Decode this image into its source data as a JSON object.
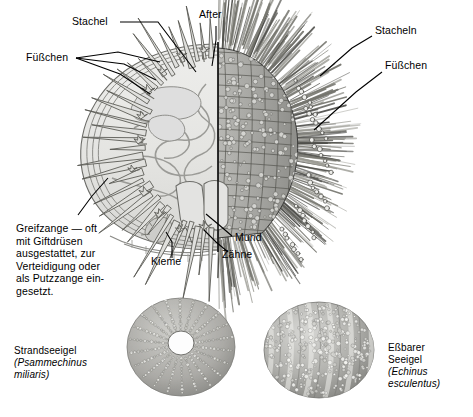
{
  "figure": {
    "background_color": "#ffffff",
    "ink_color": "#000000",
    "body_fill": "#e8e8e6",
    "shade_mid": "#9a9a98",
    "shade_dark": "#6e6e6c"
  },
  "labels": {
    "stachel": "Stachel",
    "fuesschen_left": "Füßchen",
    "after": "After",
    "stacheln_right": "Stacheln",
    "fuesschen_right": "Füßchen",
    "mund": "Mund",
    "zaehne": "Zähne",
    "kieme": "Kieme",
    "greifzange": "Greifzange — oft\nmit Giftdrüsen\nausgestattet, zur\nVerteidigung oder\nals Putzzange ein-\ngesetzt."
  },
  "specimens": [
    {
      "id": "strandseeigel",
      "common_name": "Strandseeigel",
      "scientific_name": "(Psammechinus\nmiliaris)",
      "position": "bottom-left"
    },
    {
      "id": "essbarer-seeigel",
      "common_name": "Eßbarer\nSeeigel",
      "scientific_name": "(Echinus\nesculentus)",
      "position": "bottom-right"
    }
  ],
  "anatomy_parts": [
    "Stachel",
    "Füßchen",
    "After",
    "Stacheln",
    "Mund",
    "Zähne",
    "Kieme",
    "Greifzange"
  ]
}
